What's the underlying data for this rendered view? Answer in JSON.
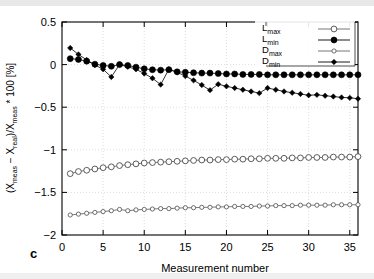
{
  "panel_label": "c",
  "axes": {
    "x_label": "Measurement number",
    "x_ticks": [
      "0",
      "5",
      "10",
      "15",
      "20",
      "25",
      "30",
      "35"
    ],
    "y_ticks": [
      "0.5",
      "0",
      "-0.5",
      "-1",
      "-1.5",
      "-2"
    ],
    "y_label_parts": {
      "p1": "(X",
      "s1": "meas",
      "p2": " − X",
      "s2": "real",
      "p3": ")/X",
      "s3": "meas",
      "p4": " * 100 [%]"
    }
  },
  "legend": {
    "position": "top-right",
    "entries": [
      {
        "base": "L",
        "sub": "max",
        "marker": "open-circle",
        "color": "#555555"
      },
      {
        "base": "L",
        "sub": "min",
        "marker": "filled-circle",
        "color": "#000000"
      },
      {
        "base": "D",
        "sub": "max",
        "marker": "open-circle-small",
        "color": "#666666"
      },
      {
        "base": "D",
        "sub": "min",
        "marker": "filled-diamond",
        "color": "#000000"
      }
    ]
  },
  "chart_data": {
    "type": "scatter",
    "title": "",
    "xlabel": "Measurement number",
    "ylabel": "(Xmeas - Xreal)/Xmeas * 100 [%]",
    "xlim": [
      0,
      36
    ],
    "ylim": [
      -2,
      0.5
    ],
    "grid": true,
    "legend_position": "top-right",
    "x": [
      1,
      2,
      3,
      4,
      5,
      6,
      7,
      8,
      9,
      10,
      11,
      12,
      13,
      14,
      15,
      16,
      17,
      18,
      19,
      20,
      21,
      22,
      23,
      24,
      25,
      26,
      27,
      28,
      29,
      30,
      31,
      32,
      33,
      34,
      35,
      36
    ],
    "series": [
      {
        "name": "Lmax",
        "marker": "open-circle",
        "values": [
          -1.28,
          -1.255,
          -1.24,
          -1.225,
          -1.21,
          -1.2,
          -1.185,
          -1.175,
          -1.165,
          -1.155,
          -1.15,
          -1.145,
          -1.14,
          -1.135,
          -1.13,
          -1.125,
          -1.12,
          -1.12,
          -1.115,
          -1.115,
          -1.11,
          -1.11,
          -1.105,
          -1.105,
          -1.1,
          -1.1,
          -1.1,
          -1.095,
          -1.095,
          -1.09,
          -1.09,
          -1.09,
          -1.085,
          -1.085,
          -1.085,
          -1.08
        ]
      },
      {
        "name": "Lmin",
        "marker": "filled-circle",
        "values": [
          0.07,
          0.06,
          0.04,
          0.005,
          -0.01,
          -0.02,
          0.0,
          -0.01,
          -0.03,
          -0.05,
          -0.06,
          -0.065,
          -0.06,
          -0.085,
          -0.09,
          -0.095,
          -0.1,
          -0.1,
          -0.105,
          -0.11,
          -0.11,
          -0.115,
          -0.115,
          -0.115,
          -0.12,
          -0.12,
          -0.12,
          -0.12,
          -0.12,
          -0.12,
          -0.12,
          -0.12,
          -0.12,
          -0.12,
          -0.12,
          -0.12
        ]
      },
      {
        "name": "Dmax",
        "marker": "open-circle-small",
        "values": [
          -1.765,
          -1.755,
          -1.745,
          -1.735,
          -1.725,
          -1.715,
          -1.7,
          -1.715,
          -1.705,
          -1.7,
          -1.695,
          -1.69,
          -1.69,
          -1.685,
          -1.68,
          -1.68,
          -1.675,
          -1.675,
          -1.67,
          -1.67,
          -1.665,
          -1.665,
          -1.665,
          -1.66,
          -1.66,
          -1.655,
          -1.655,
          -1.655,
          -1.65,
          -1.65,
          -1.65,
          -1.65,
          -1.645,
          -1.645,
          -1.645,
          -1.645
        ]
      },
      {
        "name": "Dmin",
        "marker": "filled-diamond",
        "values": [
          0.195,
          0.12,
          0.055,
          -0.005,
          -0.055,
          -0.145,
          0.0,
          -0.025,
          -0.055,
          -0.105,
          -0.16,
          -0.235,
          -0.055,
          -0.09,
          -0.135,
          -0.185,
          -0.24,
          -0.3,
          -0.23,
          -0.255,
          -0.275,
          -0.295,
          -0.315,
          -0.335,
          -0.275,
          -0.295,
          -0.315,
          -0.33,
          -0.345,
          -0.36,
          -0.355,
          -0.365,
          -0.375,
          -0.385,
          -0.39,
          -0.4
        ]
      }
    ]
  }
}
